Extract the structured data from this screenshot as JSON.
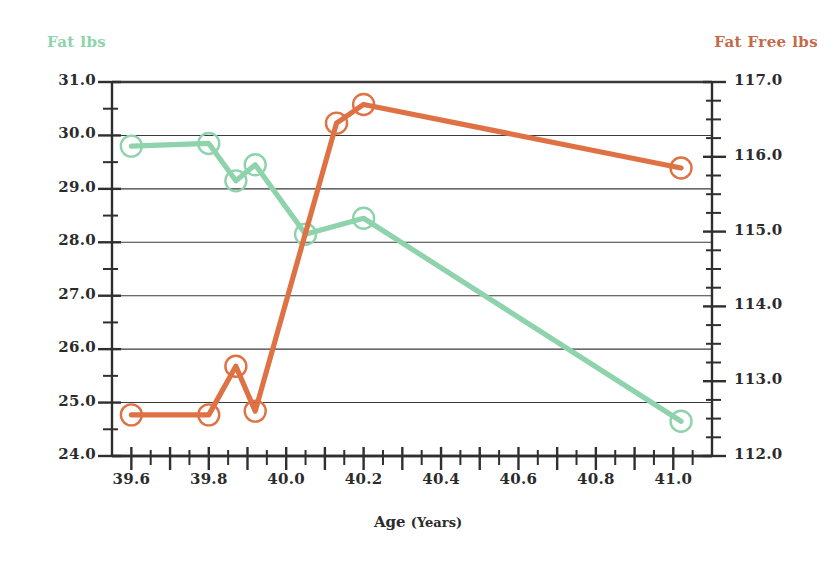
{
  "chart_data": {
    "type": "line",
    "title": "",
    "xlabel": "Age",
    "xunit": "(Years)",
    "grid": true,
    "legend": "axis-titles",
    "x": [
      39.6,
      39.8,
      39.87,
      39.92,
      40.05,
      40.2,
      41.02
    ],
    "xlim": [
      39.55,
      41.1
    ],
    "xticks": [
      39.6,
      39.8,
      40.0,
      40.2,
      40.4,
      40.6,
      40.8,
      41.0
    ],
    "xtick_labels": [
      "39.6",
      "39.8",
      "40.0",
      "40.2",
      "40.4",
      "40.6",
      "40.8",
      "41.0"
    ],
    "xminor_step": 0.05,
    "series": [
      {
        "name": "Fat lbs",
        "axis": "left",
        "color": "#8ed3ab",
        "marker": "open-circle",
        "values": [
          29.8,
          29.85,
          29.15,
          29.45,
          28.15,
          28.45,
          24.65
        ]
      },
      {
        "name": "Fat Free lbs",
        "axis": "right",
        "color": "#df7245",
        "marker": "open-circle",
        "x": [
          39.6,
          39.8,
          39.87,
          39.92,
          40.13,
          40.2,
          41.02
        ],
        "values": [
          112.55,
          112.55,
          113.2,
          112.6,
          116.45,
          116.7,
          115.85
        ]
      }
    ],
    "left_axis": {
      "label": "Fat lbs",
      "color": "#8ed3ab",
      "ylim": [
        24.0,
        31.0
      ],
      "ticks": [
        31.0,
        30.0,
        29.0,
        28.0,
        27.0,
        26.0,
        25.0,
        24.0
      ],
      "tick_labels": [
        "31.0",
        "30.0",
        "29.0",
        "28.0",
        "27.0",
        "26.0",
        "25.0",
        "24.0"
      ],
      "minor_step": 0.5
    },
    "right_axis": {
      "label": "Fat Free lbs",
      "color": "#c36a4a",
      "ylim": [
        112.0,
        117.0
      ],
      "ticks": [
        117.0,
        116.0,
        115.0,
        114.0,
        113.0,
        112.0
      ],
      "tick_labels": [
        "117.0",
        "116.0",
        "115.0",
        "114.0",
        "113.0",
        "112.0"
      ],
      "minor_step": 0.25
    }
  },
  "colors": {
    "axis": "#2f2f2f",
    "grid": "#3a3a3a",
    "green": "#8ed3ab",
    "orange": "#df7245",
    "orange_text": "#c36a4a",
    "text": "#2b2b2b",
    "background": "#ffffff"
  }
}
